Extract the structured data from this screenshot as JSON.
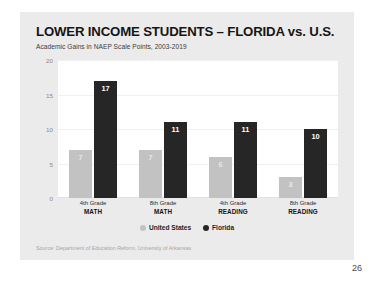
{
  "slide": {
    "page_number": "26",
    "source": "Source: Department of Education Reform, University of Arkansas"
  },
  "legend": {
    "items": [
      {
        "label": "United States",
        "color": "#c2c2c2",
        "marker": "circle-gray-icon"
      },
      {
        "label": "Florida",
        "color": "#262626",
        "marker": "circle-black-icon"
      }
    ]
  },
  "chart_data": {
    "type": "bar",
    "title": "LOWER INCOME STUDENTS – FLORIDA vs. U.S.",
    "subtitle": "Academic Gains in NAEP Scale Points, 2003-2019",
    "xlabel": "",
    "ylabel": "",
    "ylim": [
      0,
      20
    ],
    "yticks": [
      20,
      15,
      10,
      5,
      0
    ],
    "grid": true,
    "legend_position": "bottom-center",
    "categories": [
      "4th Grade MATH",
      "8th Grade MATH",
      "4th Grade READING",
      "8th Grade READING"
    ],
    "category_lines": [
      {
        "line1": "4th Grade",
        "line2": "MATH"
      },
      {
        "line1": "8th Grade",
        "line2": "MATH"
      },
      {
        "line1": "4th Grade",
        "line2": "READING"
      },
      {
        "line1": "8th Grade",
        "line2": "READING"
      }
    ],
    "series": [
      {
        "name": "United States",
        "color": "#c2c2c2",
        "values": [
          7,
          7,
          6,
          3
        ]
      },
      {
        "name": "Florida",
        "color": "#262626",
        "values": [
          17,
          11,
          11,
          10
        ]
      }
    ]
  }
}
